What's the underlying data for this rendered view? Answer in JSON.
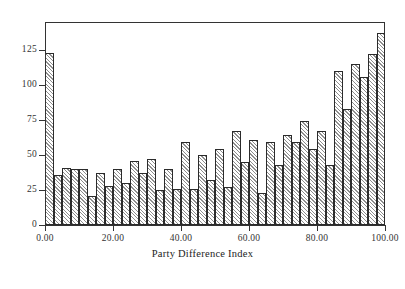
{
  "figure": {
    "caption": "",
    "x_axis_title": "Party Difference Index"
  },
  "chart_data": {
    "type": "bar",
    "title": "",
    "subtitle": "",
    "xlabel": "Party Difference Index",
    "ylabel": "",
    "xlim": [
      0,
      100
    ],
    "ylim": [
      0,
      145
    ],
    "grid": false,
    "legend": null,
    "bin_width": 2.5,
    "x_ticks": [
      0,
      20,
      40,
      60,
      80,
      100
    ],
    "x_tick_labels": [
      "0.00",
      "20.00",
      "40.00",
      "60.00",
      "80.00",
      "100.00"
    ],
    "y_ticks": [
      0,
      25,
      50,
      75,
      100,
      125
    ],
    "y_tick_labels": [
      "0",
      "25",
      "50",
      "75",
      "100",
      "125"
    ],
    "bar_fill": "#d8d8d8",
    "bar_hatch": "diagonal",
    "bar_edge_color": "#2b2b2b",
    "bin_starts": [
      0,
      2.5,
      5,
      7.5,
      10,
      12.5,
      15,
      17.5,
      20,
      22.5,
      25,
      27.5,
      30,
      32.5,
      35,
      37.5,
      40,
      42.5,
      45,
      47.5,
      50,
      52.5,
      55,
      57.5,
      60,
      62.5,
      65,
      67.5,
      70,
      72.5,
      75,
      77.5,
      80,
      82.5,
      85,
      87.5,
      90,
      92.5,
      95,
      97.5
    ],
    "categories": [
      "0.0-2.5",
      "2.5-5.0",
      "5.0-7.5",
      "7.5-10.0",
      "10.0-12.5",
      "12.5-15.0",
      "15.0-17.5",
      "17.5-20.0",
      "20.0-22.5",
      "22.5-25.0",
      "25.0-27.5",
      "27.5-30.0",
      "30.0-32.5",
      "32.5-35.0",
      "35.0-37.5",
      "37.5-40.0",
      "40.0-42.5",
      "42.5-45.0",
      "45.0-47.5",
      "47.5-50.0",
      "50.0-52.5",
      "52.5-55.0",
      "55.0-57.5",
      "57.5-60.0",
      "60.0-62.5",
      "62.5-65.0",
      "65.0-67.5",
      "67.5-70.0",
      "70.0-72.5",
      "72.5-75.0",
      "75.0-77.5",
      "77.5-80.0",
      "80.0-82.5",
      "82.5-85.0",
      "85.0-87.5",
      "87.5-90.0",
      "90.0-92.5",
      "92.5-95.0",
      "95.0-97.5",
      "97.5-100.0"
    ],
    "values": [
      123,
      36,
      41,
      40,
      40,
      21,
      37,
      28,
      40,
      30,
      46,
      37,
      47,
      25,
      40,
      26,
      59,
      26,
      50,
      32,
      54,
      27,
      67,
      45,
      61,
      23,
      59,
      43,
      64,
      59,
      74,
      54,
      67,
      43,
      110,
      83,
      115,
      106,
      122,
      137
    ]
  }
}
